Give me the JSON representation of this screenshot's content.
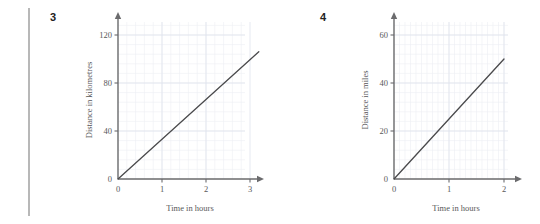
{
  "page": {
    "background_color": "#ffffff",
    "rule_color": "#b8b8b8"
  },
  "questions": [
    {
      "number": "3"
    },
    {
      "number": "4"
    }
  ],
  "colors": {
    "grid_minor": "#eceef4",
    "grid_major": "#dfe3ee",
    "axis": "#6b6b6d",
    "line": "#4a4a4c",
    "text": "#58585a"
  },
  "chart_data": [
    {
      "type": "line",
      "id": "chart-3",
      "title": "",
      "xlabel": "Time in hours",
      "ylabel": "Distance in kilometres",
      "xlim": [
        0,
        3.5
      ],
      "ylim": [
        0,
        140
      ],
      "xticks": [
        0,
        1,
        2,
        3
      ],
      "xtick_labels": [
        "0",
        "1",
        "2",
        "3"
      ],
      "yticks": [
        0,
        40,
        80,
        120
      ],
      "ytick_labels": [
        "0",
        "40",
        "80",
        "120"
      ],
      "grid": true,
      "grid_minor_step_x": 0.2,
      "grid_minor_step_y": 8,
      "legend": "none",
      "series": [
        {
          "name": "distance",
          "x": [
            0,
            3.2
          ],
          "values": [
            0,
            106
          ]
        }
      ]
    },
    {
      "type": "line",
      "id": "chart-4",
      "title": "",
      "xlabel": "Time in hours",
      "ylabel": "Distance in miles",
      "xlim": [
        0,
        2.4
      ],
      "ylim": [
        0,
        70
      ],
      "xticks": [
        0,
        1,
        2
      ],
      "xtick_labels": [
        "0",
        "1",
        "2"
      ],
      "yticks": [
        0,
        20,
        40,
        60
      ],
      "ytick_labels": [
        "0",
        "20",
        "40",
        "60"
      ],
      "grid": true,
      "grid_minor_step_x": 0.1,
      "grid_minor_step_y": 4,
      "legend": "none",
      "series": [
        {
          "name": "distance",
          "x": [
            0,
            2
          ],
          "values": [
            0,
            50
          ]
        }
      ]
    }
  ]
}
